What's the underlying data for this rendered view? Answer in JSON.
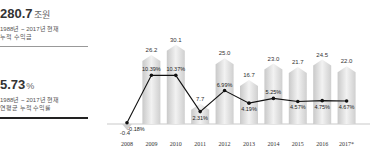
{
  "summary": {
    "total": {
      "value": "280.7",
      "unit": "조원",
      "line1": "1988년 ~ 2017년 현재",
      "line2": "누적 수익금"
    },
    "rate": {
      "value": "5.73",
      "unit": "%",
      "line1": "1988년 ~ 2017년 현재",
      "line2": "연평균 누적 수익률"
    }
  },
  "chart_data": {
    "type": "bar",
    "title": "",
    "categories": [
      "2008",
      "2009",
      "2010",
      "2011",
      "2012",
      "2013",
      "2014",
      "2015",
      "2016",
      "2017*"
    ],
    "series": [
      {
        "name": "수익금 (조원)",
        "type": "bar",
        "values": [
          -0.4,
          26.2,
          30.1,
          7.7,
          25.0,
          16.7,
          23.0,
          21.7,
          24.5,
          22.0
        ]
      },
      {
        "name": "수익률 (%)",
        "type": "line",
        "values": [
          -0.18,
          10.39,
          10.37,
          2.31,
          6.99,
          4.19,
          5.25,
          4.57,
          4.75,
          4.67
        ]
      }
    ],
    "bar_labels": [
      "-0.4",
      "26.2",
      "30.1",
      "7.7",
      "25.0",
      "16.7",
      "23.0",
      "21.7",
      "24.5",
      "22.0"
    ],
    "line_labels": [
      "-0.18%",
      "10.39%",
      "10.37%",
      "2.31%",
      "6.99%",
      "4.19%",
      "5.25%",
      "4.57%",
      "4.75%",
      "4.67%"
    ],
    "xlabel": "",
    "ylabel": "",
    "grid": false,
    "legend": "none"
  }
}
